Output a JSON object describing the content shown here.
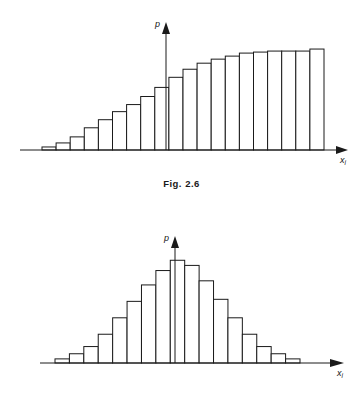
{
  "figures": [
    {
      "id": "fig-2-6",
      "caption": "Fig.  2.6",
      "y_axis_label": "p",
      "x_axis_label": "x",
      "x_axis_label_sub": "i",
      "chart_data": {
        "type": "bar",
        "title": "Fig. 2.6",
        "xlabel": "x_i",
        "ylabel": "p",
        "grid": false,
        "legend": "none",
        "note": "Monotonically increasing (cumulative-style) histogram; bars rise from near zero at left to a flat plateau at right. Origin of p-axis sits at bar index 9 (left edge of bar 10).",
        "categories": [
          "1",
          "2",
          "3",
          "4",
          "5",
          "6",
          "7",
          "8",
          "9",
          "10",
          "11",
          "12",
          "13",
          "14",
          "15",
          "16",
          "17",
          "18",
          "19",
          "20"
        ],
        "values": [
          3,
          7,
          13,
          22,
          30,
          38,
          45,
          53,
          62,
          72,
          80,
          86,
          90,
          93,
          96,
          97,
          98,
          98,
          98,
          100
        ],
        "ylim": [
          0,
          105
        ],
        "bar_count": 20
      }
    },
    {
      "id": "fig-2-7",
      "caption": "Fig.  2.7",
      "y_axis_label": "p",
      "x_axis_label": "x",
      "x_axis_label_sub": "i",
      "chart_data": {
        "type": "bar",
        "title": "Fig. 2.7",
        "xlabel": "x_i",
        "ylabel": "p",
        "grid": false,
        "legend": "none",
        "note": "Symmetric bell-shaped (normal) histogram peaking at the p-axis.",
        "categories": [
          "1",
          "2",
          "3",
          "4",
          "5",
          "6",
          "7",
          "8",
          "9",
          "10",
          "11",
          "12",
          "13",
          "14",
          "15",
          "16",
          "17"
        ],
        "values": [
          4,
          9,
          16,
          28,
          44,
          60,
          76,
          90,
          100,
          95,
          80,
          62,
          44,
          28,
          16,
          9,
          4
        ],
        "ylim": [
          0,
          110
        ],
        "bar_count": 17
      }
    }
  ]
}
